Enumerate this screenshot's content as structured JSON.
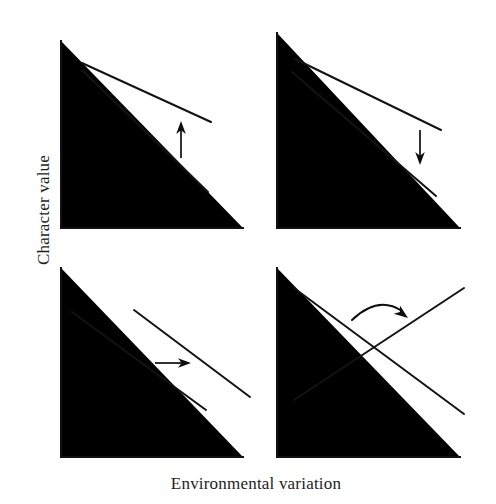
{
  "figure": {
    "type": "reaction-norm-diagram",
    "xlabel": "Environmental variation",
    "ylabel": "Character value",
    "line_color": "#131313",
    "axis_color": "#111111",
    "background": "#ffffff"
  },
  "chart_data": {
    "type": "line",
    "title": "",
    "subtitle": "",
    "xlabel": "Environmental variation",
    "ylabel": "Character value",
    "grid": false,
    "legend": "none",
    "axis_ticks": [],
    "xlim": [
      0,
      1
    ],
    "ylim": [
      0,
      1
    ],
    "panels": [
      {
        "id": "panel-top-left",
        "position": "top-left",
        "change": "slope-increase",
        "arrow": "up",
        "arrow_label": "",
        "axis": {
          "x0": 61,
          "y0": 41,
          "x1": 61,
          "y1": 228,
          "x2": 243,
          "y2": 228
        },
        "series": [
          {
            "name": "upper-reaction-norm",
            "points": [
              [
                82,
                63
              ],
              [
                211,
                122
              ]
            ]
          },
          {
            "name": "lower-reaction-norm",
            "points": [
              [
                82,
                70
              ],
              [
                208,
                192
              ]
            ]
          }
        ],
        "arrow_geometry": {
          "x1": 181,
          "y1": 158,
          "x2": 181,
          "y2": 121
        }
      },
      {
        "id": "panel-top-right",
        "position": "top-right",
        "change": "slope-decrease",
        "arrow": "down",
        "arrow_label": "",
        "axis": {
          "x0": 277,
          "y0": 33,
          "x1": 277,
          "y1": 228,
          "x2": 460,
          "y2": 228
        },
        "series": [
          {
            "name": "upper-reaction-norm",
            "points": [
              [
                295,
                59
              ],
              [
                441,
                130
              ]
            ]
          },
          {
            "name": "lower-reaction-norm",
            "points": [
              [
                292,
                72
              ],
              [
                436,
                196
              ]
            ]
          }
        ],
        "arrow_geometry": {
          "x1": 420,
          "y1": 130,
          "x2": 420,
          "y2": 165
        }
      },
      {
        "id": "panel-bottom-left",
        "position": "bottom-left",
        "change": "horizontal-shift",
        "arrow": "right",
        "arrow_label": "",
        "axis": {
          "x0": 61,
          "y0": 268,
          "x1": 61,
          "y1": 457,
          "x2": 243,
          "y2": 457
        },
        "series": [
          {
            "name": "left-reaction-norm",
            "points": [
              [
                72,
                312
              ],
              [
                206,
                410
              ]
            ]
          },
          {
            "name": "right-reaction-norm",
            "points": [
              [
                134,
                310
              ],
              [
                250,
                397
              ]
            ]
          }
        ],
        "arrow_geometry": {
          "x1": 155,
          "y1": 363,
          "x2": 191,
          "y2": 363
        }
      },
      {
        "id": "panel-bottom-right",
        "position": "bottom-right",
        "change": "slope-reversal",
        "arrow": "curved-right",
        "arrow_label": "",
        "axis": {
          "x0": 277,
          "y0": 268,
          "x1": 277,
          "y1": 457,
          "x2": 460,
          "y2": 457
        },
        "series": [
          {
            "name": "descending-reaction-norm",
            "points": [
              [
                294,
                288
              ],
              [
                464,
                414
              ]
            ]
          },
          {
            "name": "ascending-reaction-norm",
            "points": [
              [
                294,
                400
              ],
              [
                464,
                288
              ]
            ]
          }
        ],
        "arrow_geometry": {
          "x1": 352,
          "y1": 320,
          "cx": 378,
          "cy": 295,
          "x2": 406,
          "y2": 316
        }
      }
    ]
  }
}
